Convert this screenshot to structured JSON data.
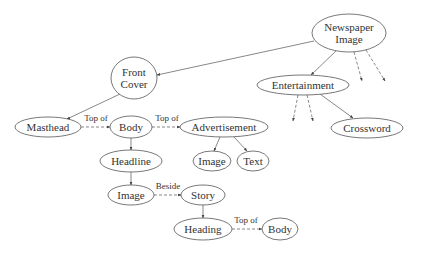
{
  "diagram": {
    "nodes": [
      {
        "id": "newspaper-image",
        "lines": [
          "Newspaper",
          "Image"
        ],
        "cx": 349,
        "cy": 33,
        "rx": 37,
        "ry": 19
      },
      {
        "id": "front-cover",
        "lines": [
          "Front",
          "Cover"
        ],
        "cx": 134,
        "cy": 78,
        "rx": 23,
        "ry": 21
      },
      {
        "id": "entertainment",
        "lines": [
          "Entertainment"
        ],
        "cx": 303,
        "cy": 85,
        "rx": 46,
        "ry": 10
      },
      {
        "id": "masthead",
        "lines": [
          "Masthead"
        ],
        "cx": 48,
        "cy": 127,
        "rx": 33,
        "ry": 10
      },
      {
        "id": "body-top",
        "lines": [
          "Body"
        ],
        "cx": 131,
        "cy": 127,
        "rx": 21,
        "ry": 11
      },
      {
        "id": "advertisement",
        "lines": [
          "Advertisement"
        ],
        "cx": 224,
        "cy": 127,
        "rx": 44,
        "ry": 10
      },
      {
        "id": "crossword",
        "lines": [
          "Crossword"
        ],
        "cx": 367,
        "cy": 128,
        "rx": 36,
        "ry": 10
      },
      {
        "id": "headline",
        "lines": [
          "Headline"
        ],
        "cx": 131,
        "cy": 161,
        "rx": 31,
        "ry": 11
      },
      {
        "id": "ad-image",
        "lines": [
          "Image"
        ],
        "cx": 212,
        "cy": 161,
        "rx": 19,
        "ry": 10
      },
      {
        "id": "ad-text",
        "lines": [
          "Text"
        ],
        "cx": 253,
        "cy": 161,
        "rx": 16,
        "ry": 10
      },
      {
        "id": "image",
        "lines": [
          "Image"
        ],
        "cx": 131,
        "cy": 195,
        "rx": 23,
        "ry": 10
      },
      {
        "id": "story",
        "lines": [
          "Story"
        ],
        "cx": 203,
        "cy": 195,
        "rx": 22,
        "ry": 10
      },
      {
        "id": "heading",
        "lines": [
          "Heading"
        ],
        "cx": 203,
        "cy": 229,
        "rx": 29,
        "ry": 11
      },
      {
        "id": "body-bottom",
        "lines": [
          "Body"
        ],
        "cx": 280,
        "cy": 229,
        "rx": 18,
        "ry": 11
      }
    ],
    "edges": [
      {
        "from": "newspaper-image",
        "to": "front-cover",
        "x1": 314,
        "y1": 41,
        "x2": 157,
        "y2": 75,
        "dashed": false,
        "label": ""
      },
      {
        "from": "newspaper-image",
        "to": "entertainment",
        "x1": 336,
        "y1": 51,
        "x2": 311,
        "y2": 75,
        "dashed": false,
        "label": ""
      },
      {
        "from": "newspaper-image",
        "to": "unnamed-1",
        "x1": 354,
        "y1": 52,
        "x2": 362,
        "y2": 81,
        "dashed": true,
        "label": ""
      },
      {
        "from": "newspaper-image",
        "to": "unnamed-2",
        "x1": 366,
        "y1": 50,
        "x2": 385,
        "y2": 81,
        "dashed": true,
        "label": ""
      },
      {
        "from": "front-cover",
        "to": "masthead",
        "x1": 120,
        "y1": 94,
        "x2": 67,
        "y2": 119,
        "dashed": false,
        "label": ""
      },
      {
        "from": "masthead",
        "to": "body-top",
        "x1": 81,
        "y1": 127,
        "x2": 110,
        "y2": 127,
        "dashed": true,
        "label": "Top of",
        "lx": 96,
        "ly": 121
      },
      {
        "from": "body-top",
        "to": "advertisement",
        "x1": 152,
        "y1": 127,
        "x2": 180,
        "y2": 127,
        "dashed": true,
        "label": "Top of",
        "lx": 167,
        "ly": 121
      },
      {
        "from": "entertainment",
        "to": "unnamed-3",
        "x1": 298,
        "y1": 95,
        "x2": 293,
        "y2": 121,
        "dashed": true,
        "label": ""
      },
      {
        "from": "entertainment",
        "to": "unnamed-4",
        "x1": 307,
        "y1": 95,
        "x2": 313,
        "y2": 121,
        "dashed": true,
        "label": ""
      },
      {
        "from": "entertainment",
        "to": "crossword",
        "x1": 320,
        "y1": 94,
        "x2": 353,
        "y2": 118,
        "dashed": false,
        "label": ""
      },
      {
        "from": "body-top",
        "to": "headline",
        "x1": 131,
        "y1": 138,
        "x2": 131,
        "y2": 150,
        "dashed": false,
        "label": ""
      },
      {
        "from": "advertisement",
        "to": "ad-image",
        "x1": 220,
        "y1": 137,
        "x2": 214,
        "y2": 151,
        "dashed": false,
        "label": ""
      },
      {
        "from": "advertisement",
        "to": "ad-text",
        "x1": 234,
        "y1": 137,
        "x2": 247,
        "y2": 151,
        "dashed": false,
        "label": ""
      },
      {
        "from": "headline",
        "to": "image",
        "x1": 131,
        "y1": 172,
        "x2": 131,
        "y2": 185,
        "dashed": false,
        "label": ""
      },
      {
        "from": "image",
        "to": "story",
        "x1": 154,
        "y1": 195,
        "x2": 181,
        "y2": 195,
        "dashed": true,
        "label": "Beside",
        "lx": 168,
        "ly": 189
      },
      {
        "from": "story",
        "to": "heading",
        "x1": 203,
        "y1": 205,
        "x2": 203,
        "y2": 218,
        "dashed": false,
        "label": ""
      },
      {
        "from": "heading",
        "to": "body-bottom",
        "x1": 232,
        "y1": 229,
        "x2": 262,
        "y2": 229,
        "dashed": true,
        "label": "Top of",
        "lx": 246,
        "ly": 223
      }
    ]
  }
}
